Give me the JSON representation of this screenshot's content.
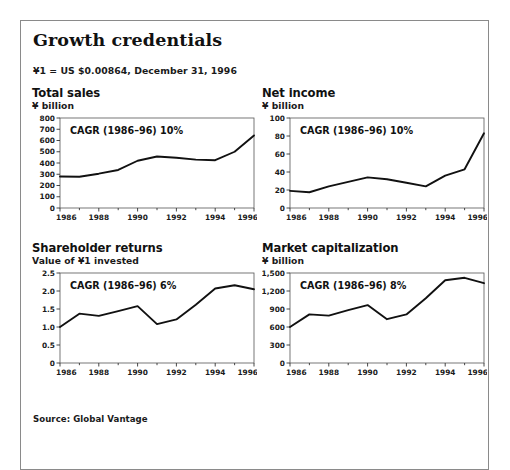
{
  "exhibit": {
    "title": "Growth credentials",
    "fx_note": "¥1 = US $0.00864, December 31, 1996",
    "source": "Source: Global Vantage"
  },
  "chart_data": [
    {
      "type": "line",
      "id": "total-sales",
      "title": "Total sales",
      "subtitle": "¥ billion",
      "annotation": "CAGR (1986–96) 10%",
      "xlabel": "",
      "ylabel": "¥ billion",
      "x": [
        1986,
        1987,
        1988,
        1989,
        1990,
        1991,
        1992,
        1993,
        1994,
        1995,
        1996
      ],
      "values": [
        280,
        278,
        305,
        338,
        420,
        458,
        447,
        430,
        425,
        500,
        645
      ],
      "xlim": [
        1986,
        1996
      ],
      "ylim": [
        0,
        800
      ],
      "yticks": [
        0,
        100,
        200,
        300,
        400,
        500,
        600,
        700,
        800
      ],
      "ytick_labels": [
        "0",
        "100",
        "200",
        "300",
        "400",
        "500",
        "600",
        "700",
        "800"
      ],
      "xticks": [
        1986,
        1988,
        1990,
        1992,
        1994,
        1996
      ],
      "xtick_labels": [
        "1986",
        "1988",
        "1990",
        "1992",
        "1994",
        "1996"
      ],
      "grid": false,
      "legend": "none",
      "line_color": "#111111"
    },
    {
      "type": "line",
      "id": "net-income",
      "title": "Net income",
      "subtitle": "¥ billion",
      "annotation": "CAGR (1986–96) 10%",
      "xlabel": "",
      "ylabel": "¥ billion",
      "x": [
        1986,
        1987,
        1988,
        1989,
        1990,
        1991,
        1992,
        1993,
        1994,
        1995,
        1996
      ],
      "values": [
        19,
        17.5,
        24,
        29,
        34,
        32,
        28,
        24,
        36,
        43,
        83
      ],
      "xlim": [
        1986,
        1996
      ],
      "ylim": [
        0,
        100
      ],
      "yticks": [
        0,
        20,
        40,
        60,
        80,
        100
      ],
      "ytick_labels": [
        "0",
        "20",
        "40",
        "60",
        "80",
        "100"
      ],
      "xticks": [
        1986,
        1988,
        1990,
        1992,
        1994,
        1996
      ],
      "xtick_labels": [
        "1986",
        "1988",
        "1990",
        "1992",
        "1994",
        "1996"
      ],
      "grid": false,
      "legend": "none",
      "line_color": "#111111"
    },
    {
      "type": "line",
      "id": "shareholder-returns",
      "title": "Shareholder returns",
      "subtitle": "Value of ¥1 invested",
      "annotation": "CAGR (1986–96) 6%",
      "xlabel": "",
      "ylabel": "Value of ¥1 invested",
      "x": [
        1986,
        1987,
        1988,
        1989,
        1990,
        1991,
        1992,
        1993,
        1994,
        1995,
        1996
      ],
      "values": [
        1.0,
        1.37,
        1.31,
        1.44,
        1.58,
        1.08,
        1.21,
        1.62,
        2.07,
        2.16,
        2.05
      ],
      "xlim": [
        1986,
        1996
      ],
      "ylim": [
        0,
        2.5
      ],
      "yticks": [
        0,
        0.5,
        1.0,
        1.5,
        2.0,
        2.5
      ],
      "ytick_labels": [
        "0",
        "0.5",
        "1.0",
        "1.5",
        "2.0",
        "2.5"
      ],
      "xticks": [
        1986,
        1988,
        1990,
        1992,
        1994,
        1996
      ],
      "xtick_labels": [
        "1986",
        "1988",
        "1990",
        "1992",
        "1994",
        "1996"
      ],
      "grid": false,
      "legend": "none",
      "line_color": "#111111"
    },
    {
      "type": "line",
      "id": "market-capitalization",
      "title": "Market capitalization",
      "subtitle": "¥ billion",
      "annotation": "CAGR (1986–96) 8%",
      "xlabel": "",
      "ylabel": "¥ billion",
      "x": [
        1986,
        1987,
        1988,
        1989,
        1990,
        1991,
        1992,
        1993,
        1994,
        1995,
        1996
      ],
      "values": [
        600,
        810,
        790,
        880,
        965,
        730,
        810,
        1080,
        1380,
        1420,
        1330
      ],
      "xlim": [
        1986,
        1996
      ],
      "ylim": [
        0,
        1500
      ],
      "yticks": [
        0,
        300,
        600,
        900,
        1200,
        1500
      ],
      "ytick_labels": [
        "0",
        "300",
        "600",
        "900",
        "1,200",
        "1,500"
      ],
      "xticks": [
        1986,
        1988,
        1990,
        1992,
        1994,
        1996
      ],
      "xtick_labels": [
        "1986",
        "1988",
        "1990",
        "1992",
        "1994",
        "1996"
      ],
      "grid": false,
      "legend": "none",
      "line_color": "#111111"
    }
  ]
}
